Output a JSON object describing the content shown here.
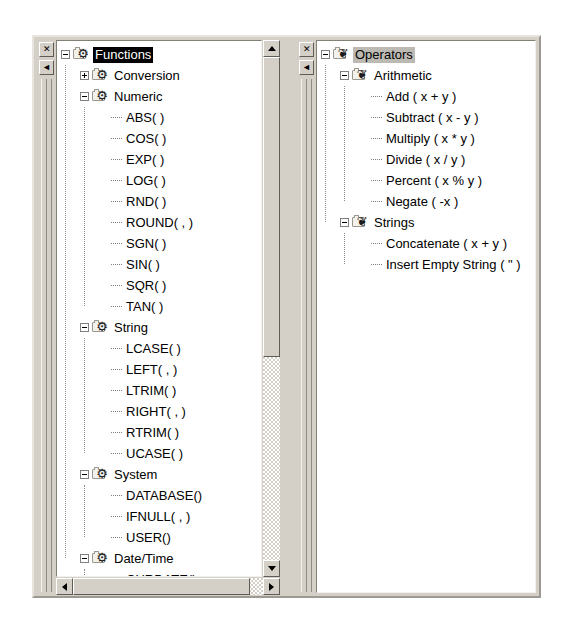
{
  "window": {
    "left_panel": {
      "name": "Functions tree",
      "close_label": "✕",
      "collapse_label": "◄",
      "selected_node": "Functions",
      "selection_state": "active",
      "tree": [
        {
          "label": "Functions",
          "level": 0,
          "type": "branch",
          "icon": "gear-folder-icon",
          "expander": "minus",
          "selected": true
        },
        {
          "label": "Conversion",
          "level": 1,
          "type": "branch",
          "icon": "gear-folder-icon",
          "expander": "plus",
          "selected": false
        },
        {
          "label": "Numeric",
          "level": 1,
          "type": "branch",
          "icon": "gear-folder-icon",
          "expander": "minus",
          "selected": false
        },
        {
          "label": "ABS( )",
          "level": 2,
          "type": "leaf"
        },
        {
          "label": "COS( )",
          "level": 2,
          "type": "leaf"
        },
        {
          "label": "EXP( )",
          "level": 2,
          "type": "leaf"
        },
        {
          "label": "LOG( )",
          "level": 2,
          "type": "leaf"
        },
        {
          "label": "RND( )",
          "level": 2,
          "type": "leaf"
        },
        {
          "label": "ROUND( , )",
          "level": 2,
          "type": "leaf"
        },
        {
          "label": "SGN( )",
          "level": 2,
          "type": "leaf"
        },
        {
          "label": "SIN( )",
          "level": 2,
          "type": "leaf"
        },
        {
          "label": "SQR( )",
          "level": 2,
          "type": "leaf"
        },
        {
          "label": "TAN( )",
          "level": 2,
          "type": "leaf"
        },
        {
          "label": "String",
          "level": 1,
          "type": "branch",
          "icon": "gear-folder-icon",
          "expander": "minus",
          "selected": false
        },
        {
          "label": "LCASE( )",
          "level": 2,
          "type": "leaf"
        },
        {
          "label": "LEFT( , )",
          "level": 2,
          "type": "leaf"
        },
        {
          "label": "LTRIM( )",
          "level": 2,
          "type": "leaf"
        },
        {
          "label": "RIGHT( , )",
          "level": 2,
          "type": "leaf"
        },
        {
          "label": "RTRIM( )",
          "level": 2,
          "type": "leaf"
        },
        {
          "label": "UCASE( )",
          "level": 2,
          "type": "leaf"
        },
        {
          "label": "System",
          "level": 1,
          "type": "branch",
          "icon": "gear-folder-icon",
          "expander": "minus",
          "selected": false
        },
        {
          "label": "DATABASE()",
          "level": 2,
          "type": "leaf"
        },
        {
          "label": "IFNULL( , )",
          "level": 2,
          "type": "leaf"
        },
        {
          "label": "USER()",
          "level": 2,
          "type": "leaf"
        },
        {
          "label": "Date/Time",
          "level": 1,
          "type": "branch",
          "icon": "gear-folder-icon",
          "expander": "minus",
          "selected": false
        },
        {
          "label": "CURDATE()",
          "level": 2,
          "type": "leaf"
        }
      ],
      "vscrollbar": {
        "up_arrow": "▲",
        "down_arrow": "▼"
      },
      "hscrollbar": {
        "left_arrow": "◄",
        "right_arrow": "►"
      }
    },
    "right_panel": {
      "name": "Operators tree",
      "close_label": "✕",
      "collapse_label": "◄",
      "selected_node": "Operators",
      "selection_state": "inactive",
      "tree": [
        {
          "label": "Operators",
          "level": 0,
          "type": "branch",
          "icon": "puzzle-folder-icon",
          "expander": "minus",
          "selected": true
        },
        {
          "label": "Arithmetic",
          "level": 1,
          "type": "branch",
          "icon": "puzzle-folder-icon",
          "expander": "minus",
          "selected": false
        },
        {
          "label": "Add ( x + y )",
          "level": 2,
          "type": "leaf"
        },
        {
          "label": "Subtract ( x - y )",
          "level": 2,
          "type": "leaf"
        },
        {
          "label": "Multiply ( x * y )",
          "level": 2,
          "type": "leaf"
        },
        {
          "label": "Divide ( x / y )",
          "level": 2,
          "type": "leaf"
        },
        {
          "label": "Percent ( x % y )",
          "level": 2,
          "type": "leaf"
        },
        {
          "label": "Negate ( -x )",
          "level": 2,
          "type": "leaf"
        },
        {
          "label": "Strings",
          "level": 1,
          "type": "branch",
          "icon": "puzzle-folder-icon",
          "expander": "minus",
          "selected": false
        },
        {
          "label": "Concatenate ( x + y )",
          "level": 2,
          "type": "leaf"
        },
        {
          "label": "Insert Empty String ( \" )",
          "level": 2,
          "type": "leaf"
        }
      ]
    },
    "colors": {
      "chrome": "#d4d0c8",
      "client": "#ffffff",
      "selection_active_bg": "#000000",
      "selection_active_fg": "#ffffff",
      "selection_inactive_bg": "#bdbab4",
      "text": "#000000",
      "guide_line": "#8a8a8a"
    }
  }
}
